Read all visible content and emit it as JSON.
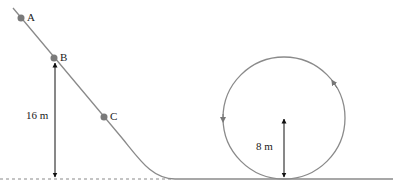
{
  "diagram": {
    "points": [
      {
        "label": "A",
        "x": 21,
        "y": 18
      },
      {
        "label": "B",
        "x": 54,
        "y": 58
      },
      {
        "label": "C",
        "x": 104,
        "y": 117
      }
    ],
    "heights": {
      "ramp_label": "16 m",
      "loop_label": "8 m"
    },
    "colors": {
      "track": "#8a8a8a",
      "dot": "#7a7a7a",
      "arrow": "#111111",
      "text": "#222222"
    }
  }
}
